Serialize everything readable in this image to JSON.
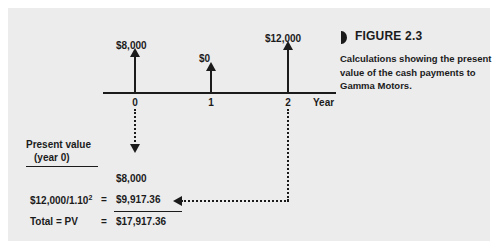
{
  "figure": {
    "marker_icon": "figure-marker-icon",
    "title": "FIGURE 2.3",
    "caption": "Calculations showing the present value of the cash payments to Gamma Motors."
  },
  "timeline": {
    "axis_title": "Year",
    "tick_labels": [
      "0",
      "1",
      "2"
    ],
    "cash_flow_labels": [
      "$8,000",
      "$0",
      "$12,000"
    ]
  },
  "present_value": {
    "heading_line1": "Present value",
    "heading_line2": "(year 0)",
    "rows": [
      {
        "left": "",
        "eq": "",
        "value": "$8,000"
      },
      {
        "left": "$12,000/1.10",
        "exponent": "2",
        "eq": "=",
        "value": "$9,917.36"
      },
      {
        "left": "Total = PV",
        "eq": "=",
        "value": "$17,917.36"
      }
    ]
  },
  "colors": {
    "panel_background": "#ececed",
    "ink": "#1b1b1b",
    "page_background": "#ffffff"
  },
  "chart_data": {
    "type": "bar",
    "title": "FIGURE 2.3",
    "subtitle": "Calculations showing the present value of the cash payments to Gamma Motors.",
    "xlabel": "Year",
    "ylabel": "",
    "categories": [
      "0",
      "1",
      "2"
    ],
    "values": [
      8000,
      0,
      12000
    ],
    "data_labels": [
      "$8,000",
      "$0",
      "$12,000"
    ],
    "grid": false,
    "legend": "none",
    "annotations": [
      "Present value (year 0)",
      "$8,000",
      "$12,000/1.10^2 = $9,917.36",
      "Total = PV = $17,917.36"
    ],
    "discount_rate": 1.1,
    "present_values": [
      8000,
      0,
      9917.36
    ],
    "total_present_value": 17917.36
  }
}
